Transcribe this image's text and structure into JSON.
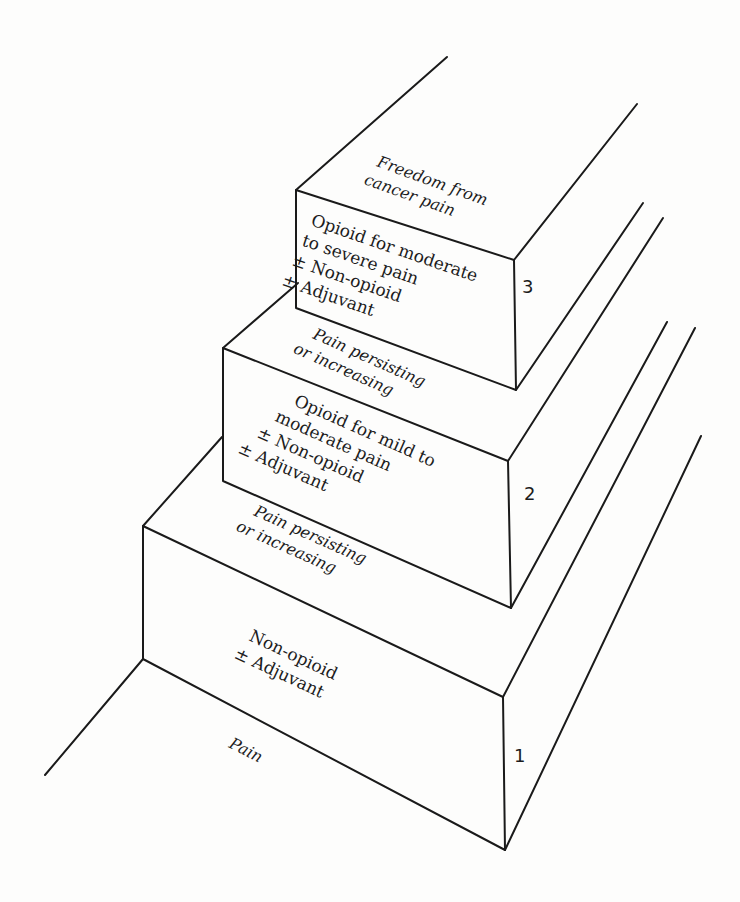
{
  "diagram": {
    "type": "three-step analgesic ladder",
    "colors": {
      "line": "#1a1a1a",
      "text": "#1c1c1c",
      "background": "#fdfdfc"
    },
    "base_label": "Pain",
    "steps": [
      {
        "number": "1",
        "front_lines": [
          "Non-opioid",
          "± Adjuvant"
        ],
        "top_lines": [
          "Pain persisting",
          "or increasing"
        ]
      },
      {
        "number": "2",
        "front_lines": [
          "Opioid for mild to",
          "moderate pain",
          "± Non-opioid",
          "± Adjuvant"
        ],
        "top_lines": [
          "Pain persisting",
          "or increasing"
        ]
      },
      {
        "number": "3",
        "front_lines": [
          "Opioid for moderate",
          "to severe pain",
          "± Non-opioid",
          "± Adjuvant"
        ],
        "top_lines": [
          "Freedom from",
          "cancer pain"
        ]
      }
    ]
  }
}
